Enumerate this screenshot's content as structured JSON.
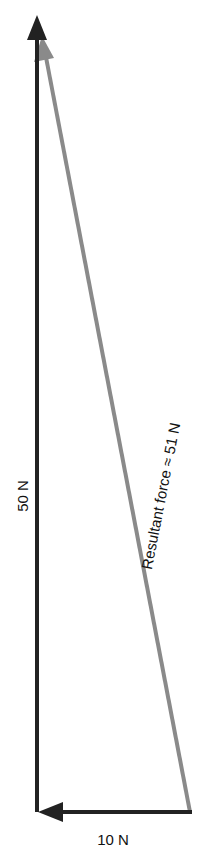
{
  "diagram": {
    "type": "vector-addition",
    "colors": {
      "component": "#222222",
      "resultant": "#8a8a8a",
      "text": "#111111"
    },
    "vectors": [
      {
        "name": "vertical-force",
        "label": "50 N",
        "magnitude": 50,
        "direction": "up"
      },
      {
        "name": "horizontal-force",
        "label": "10 N",
        "magnitude": 10,
        "direction": "left"
      },
      {
        "name": "resultant-force",
        "label": "Resultant force ≈ 51 N",
        "magnitude": 51
      }
    ]
  }
}
